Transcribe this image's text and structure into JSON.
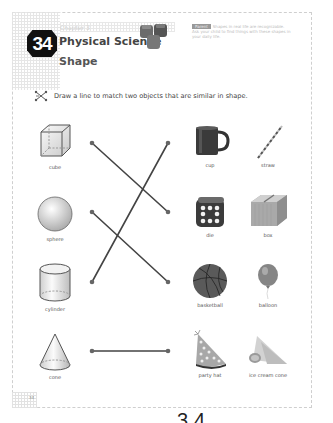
{
  "header": {
    "lesson_number": "34",
    "chapter_label": "Chapter 3",
    "subject": "Physical Science",
    "topic": "Shape",
    "note_tag": "Parent",
    "note_text": "Shapes in real life are recognizable. Ask your child to find things with these shapes in your daily life."
  },
  "instruction": {
    "icon": "matching-lines-icon",
    "text": "Draw a line to match two objects that are similar in shape."
  },
  "left_column": [
    {
      "label": "cube",
      "icon": "cube-icon"
    },
    {
      "label": "sphere",
      "icon": "sphere-icon"
    },
    {
      "label": "cylinder",
      "icon": "cylinder-icon"
    },
    {
      "label": "cone",
      "icon": "cone-icon"
    }
  ],
  "right_column": [
    {
      "label": "cup",
      "icon": "mug-icon"
    },
    {
      "label": "straw",
      "icon": "straw-icon"
    },
    {
      "label": "die",
      "icon": "die-icon"
    },
    {
      "label": "box",
      "icon": "box-icon"
    },
    {
      "label": "basketball",
      "icon": "basketball-icon"
    },
    {
      "label": "balloon",
      "icon": "balloon-icon"
    },
    {
      "label": "party hat",
      "icon": "party-hat-icon"
    },
    {
      "label": "ice cream cone",
      "icon": "ice-cream-cone-icon"
    }
  ],
  "matches": [
    {
      "from": "cube",
      "to": "die"
    },
    {
      "from": "sphere",
      "to": "basketball"
    },
    {
      "from": "cylinder",
      "to": "cup"
    },
    {
      "from": "cone",
      "to": "party hat"
    }
  ],
  "footer": {
    "page_number": "34",
    "bottom_number": "34"
  }
}
